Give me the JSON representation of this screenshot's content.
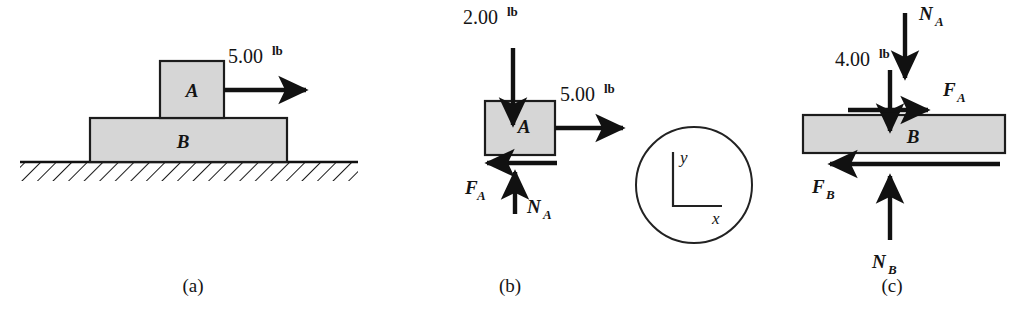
{
  "figure": {
    "background_color": "#ffffff",
    "block_fill_color": "#d6d6d6",
    "line_color": "#111111",
    "panels": [
      {
        "id": "a",
        "caption": "(a)",
        "description": "Block A resting on block B on hatched ground, with applied 5.00 lb force",
        "blocks": [
          {
            "label": "A",
            "name": "block-a"
          },
          {
            "label": "B",
            "name": "block-b"
          }
        ],
        "forces": [
          {
            "name": "applied-force-5lb",
            "magnitude": "5.00",
            "unit": "lb",
            "direction": "right"
          }
        ],
        "ground": {
          "name": "ground-hatching",
          "style": "hatched"
        }
      },
      {
        "id": "b",
        "caption": "(b)",
        "description": "Free-body diagram of block A",
        "blocks": [
          {
            "label": "A",
            "name": "block-a"
          }
        ],
        "forces": [
          {
            "name": "weight-2lb",
            "magnitude": "2.00",
            "unit": "lb",
            "direction": "down"
          },
          {
            "name": "applied-force-5lb",
            "magnitude": "5.00",
            "unit": "lb",
            "direction": "right"
          },
          {
            "name": "friction-fa",
            "symbol": "F",
            "subscript": "A",
            "direction": "left"
          },
          {
            "name": "normal-na",
            "symbol": "N",
            "subscript": "A",
            "direction": "up"
          }
        ]
      },
      {
        "id": "c",
        "caption": "(c)",
        "description": "Free-body diagram of block B",
        "blocks": [
          {
            "label": "B",
            "name": "block-b"
          }
        ],
        "forces": [
          {
            "name": "normal-na-reaction",
            "symbol": "N",
            "subscript": "A",
            "direction": "down"
          },
          {
            "name": "weight-4lb",
            "magnitude": "4.00",
            "unit": "lb",
            "direction": "down"
          },
          {
            "name": "friction-fa-reaction",
            "symbol": "F",
            "subscript": "A",
            "direction": "right"
          },
          {
            "name": "friction-fb",
            "symbol": "F",
            "subscript": "B",
            "direction": "left"
          },
          {
            "name": "normal-nb",
            "symbol": "N",
            "subscript": "B",
            "direction": "up"
          }
        ]
      }
    ],
    "axis_key": {
      "name": "coordinate-axes-key",
      "y_label": "y",
      "x_label": "x",
      "shape": "circle"
    },
    "labels": {
      "block_a": "A",
      "block_b": "B",
      "mag_5": "5.00",
      "mag_2": "2.00",
      "mag_4": "4.00",
      "unit_lb": "lb",
      "sym_F": "F",
      "sym_N": "N",
      "sub_A": "A",
      "sub_B": "B",
      "axis_y": "y",
      "axis_x": "x",
      "caption_a": "(a)",
      "caption_b": "(b)",
      "caption_c": "(c)"
    }
  }
}
